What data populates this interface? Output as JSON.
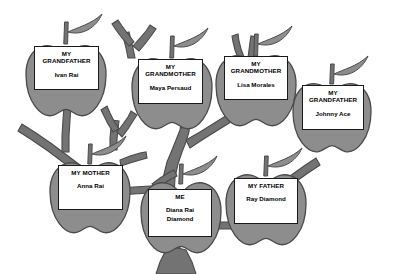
{
  "diagram": {
    "type": "apple-family-tree",
    "colors": {
      "background": "#ffffff",
      "apple_fill": "#8d8d8d",
      "apple_stroke": "#4a4a4a",
      "leaf_fill": "#8d8d8d",
      "leaf_stroke": "#4a4a4a",
      "branch_fill": "#737373",
      "branch_stroke": "#4a4a4a",
      "label_fill": "#ffffff",
      "label_stroke": "#1a1a1a",
      "text": "#000000"
    }
  },
  "nodes": [
    {
      "id": "grandfather-paternal-maternal",
      "title": "MY\nGRANDFATHER",
      "name": "Ivan Rai",
      "apple": {
        "cx": 66,
        "cy": 79,
        "rx": 40,
        "ry": 38
      },
      "leaf": {
        "x": 68,
        "y": 18,
        "dir": "right"
      },
      "stem": {
        "x": 66,
        "y": 22,
        "h": 22
      },
      "box": {
        "x": 34,
        "y": 46,
        "w": 65,
        "h": 44
      }
    },
    {
      "id": "grandmother-maternal",
      "title": "MY\nGRANDMOTHER",
      "name": "Maya Persaud",
      "apple": {
        "cx": 172,
        "cy": 92,
        "rx": 40,
        "ry": 38
      },
      "leaf": {
        "x": 174,
        "y": 32,
        "dir": "right"
      },
      "stem": {
        "x": 172,
        "y": 36,
        "h": 22
      },
      "box": {
        "x": 138,
        "y": 59,
        "w": 65,
        "h": 45
      }
    },
    {
      "id": "grandmother-paternal",
      "title": "MY\nGRANDMOTHER",
      "name": "Lisa Morales",
      "apple": {
        "cx": 256,
        "cy": 89,
        "rx": 40,
        "ry": 38
      },
      "leaf": {
        "x": 258,
        "y": 30,
        "dir": "right"
      },
      "stem": {
        "x": 256,
        "y": 34,
        "h": 22
      },
      "box": {
        "x": 224,
        "y": 56,
        "w": 64,
        "h": 44
      }
    },
    {
      "id": "grandfather-paternal",
      "title": "MY\nGRANDFATHER",
      "name": "Johnny Ace",
      "apple": {
        "cx": 332,
        "cy": 116,
        "rx": 39,
        "ry": 37
      },
      "leaf": {
        "x": 334,
        "y": 60,
        "dir": "right"
      },
      "stem": {
        "x": 332,
        "y": 64,
        "h": 20
      },
      "box": {
        "x": 302,
        "y": 85,
        "w": 62,
        "h": 45
      }
    },
    {
      "id": "mother",
      "title": "MY MOTHER",
      "name": "Anna Rai",
      "apple": {
        "cx": 90,
        "cy": 196,
        "rx": 40,
        "ry": 38
      },
      "leaf": {
        "x": 92,
        "y": 140,
        "dir": "right"
      },
      "stem": {
        "x": 90,
        "y": 144,
        "h": 20
      },
      "box": {
        "x": 58,
        "y": 165,
        "w": 65,
        "h": 45
      }
    },
    {
      "id": "me",
      "title": "ME",
      "name": "Diana Rai\nDiamond",
      "apple": {
        "cx": 181,
        "cy": 216,
        "rx": 40,
        "ry": 38
      },
      "leaf": {
        "x": 183,
        "y": 160,
        "dir": "right"
      },
      "stem": {
        "x": 181,
        "y": 164,
        "h": 20
      },
      "box": {
        "x": 148,
        "y": 189,
        "w": 64,
        "h": 48
      }
    },
    {
      "id": "father",
      "title": "MY FATHER",
      "name": "Ray Diamond",
      "apple": {
        "cx": 266,
        "cy": 208,
        "rx": 40,
        "ry": 38
      },
      "leaf": {
        "x": 268,
        "y": 152,
        "dir": "right"
      },
      "stem": {
        "x": 266,
        "y": 156,
        "h": 20
      },
      "box": {
        "x": 234,
        "y": 178,
        "w": 64,
        "h": 46
      }
    }
  ]
}
